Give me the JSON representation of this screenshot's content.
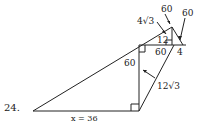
{
  "problem_number": "24.",
  "labels": {
    "top_60_a": "60",
    "top_60_b": "60",
    "four_root3": "4√3",
    "twelve": "12",
    "sixty_base": "60",
    "four": "4",
    "sixty_vertical": "60",
    "twelve_root3": "12√3",
    "x_value": "x = 36"
  },
  "colors": {
    "stroke": "#222222",
    "background": "#ffffff"
  }
}
